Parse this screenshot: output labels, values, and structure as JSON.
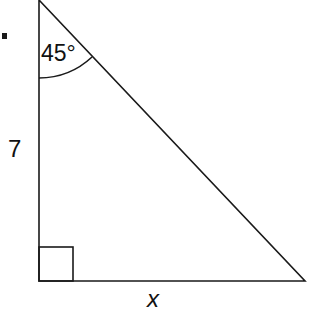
{
  "diagram": {
    "type": "right-triangle",
    "angle_label": "45°",
    "vertical_side_label": "7",
    "horizontal_side_label": "x",
    "stroke_color": "#1a1a1a"
  }
}
